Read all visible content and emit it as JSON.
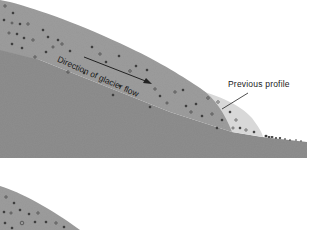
{
  "diagram": {
    "type": "glacier-cross-section",
    "panels": [
      {
        "id": "upper",
        "labels": {
          "flow_direction": "Direction of glacier flow",
          "previous_profile": "Previous profile"
        },
        "arrow": {
          "direction": "down-slope",
          "from": [
            85,
            57
          ],
          "to": [
            150,
            83
          ]
        }
      },
      {
        "id": "lower-partial",
        "labels": {}
      }
    ],
    "colors": {
      "bedrock": "#8f8f8f",
      "ice": "#9c9c9c",
      "previous_profile": "#d6d6d6",
      "debris": "#3a3a3a",
      "background": "#ffffff"
    }
  }
}
